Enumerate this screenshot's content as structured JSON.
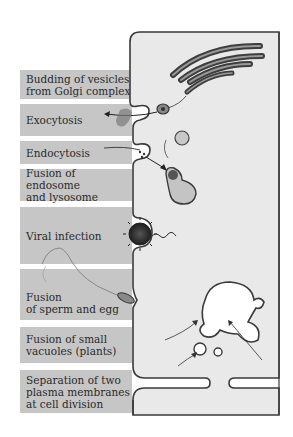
{
  "diagram": {
    "labels": [
      {
        "id": "budding",
        "text": "Budding of vesicles\nfrom Golgi complex",
        "top": 70,
        "height": 29
      },
      {
        "id": "exocytosis",
        "text": "Exocytosis",
        "top": 104,
        "height": 32
      },
      {
        "id": "endocytosis",
        "text": "Endocytosis",
        "top": 141,
        "height": 23
      },
      {
        "id": "endosome-lysosome",
        "text": "Fusion of endosome\nand lysosome",
        "top": 169,
        "height": 32
      },
      {
        "id": "viral-infection",
        "text": "Viral infection",
        "top": 207,
        "height": 57
      },
      {
        "id": "sperm-egg",
        "text": "Fusion\nof sperm and egg",
        "top": 269,
        "height": 51
      },
      {
        "id": "small-vacuoles",
        "text": "Fusion of small\nvacuoles (plants)",
        "top": 327,
        "height": 36
      },
      {
        "id": "cell-division",
        "text": "Separation of two\nplasma membranes\nat cell division",
        "top": 370,
        "height": 43
      }
    ],
    "colors": {
      "label_background": "#c6c6c6",
      "cell_fill": "#e9e9e9",
      "membrane": "#3a3a3a",
      "vacuole_fill": "#ffffff",
      "organelle_fill": "#bdbdbd"
    }
  }
}
